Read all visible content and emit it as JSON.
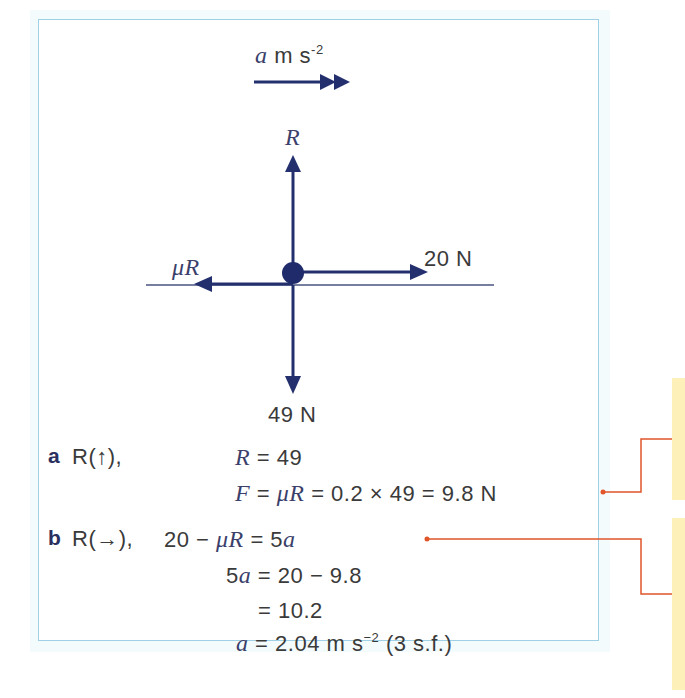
{
  "diagram": {
    "colors": {
      "arrow": "#24306e",
      "frame_border": "#9fd0e6",
      "annotation_line": "#e0552a",
      "note_background": "#fdf0b8"
    },
    "acceleration_label": {
      "var": "a",
      "unit": "m s",
      "exp": "-2"
    },
    "forces": {
      "up": {
        "label": "R"
      },
      "left": {
        "label": "μR"
      },
      "right": {
        "label": "20 N"
      },
      "down": {
        "label": "49 N"
      }
    }
  },
  "solution": {
    "part_a": {
      "label": "a",
      "resolve": "R(↑),",
      "lines": [
        {
          "lhs_var": "R",
          "rhs": "= 49"
        },
        {
          "lhs_var": "F",
          "mid": "=",
          "mid_var": "μR",
          "rhs": "= 0.2 × 49 = 9.8 N"
        }
      ]
    },
    "part_b": {
      "label": "b",
      "resolve": "R(→),",
      "lines": [
        {
          "pre": "20 − ",
          "var": "μR",
          "mid": " = 5",
          "var2": "a"
        },
        {
          "pre": "5",
          "var": "a",
          "rhs": " = 20 − 9.8"
        },
        {
          "rhs": "= 10.2"
        },
        {
          "var": "a",
          "rhs": " = 2.04 m s",
          "exp": "−2",
          "post": " (3 s.f.)"
        }
      ]
    }
  }
}
